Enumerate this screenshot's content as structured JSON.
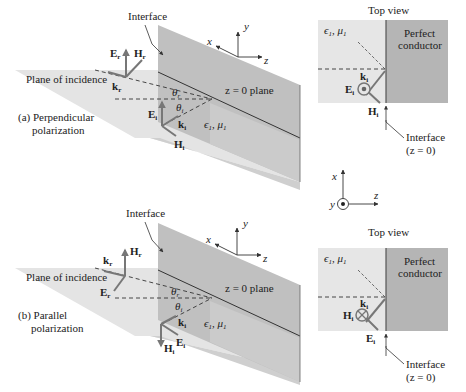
{
  "figure": {
    "panels": [
      {
        "id": "a",
        "caption_line1": "(a) Perpendicular",
        "caption_line2": "polarization",
        "plane_label": "Plane of incidence",
        "interface_label": "Interface",
        "z_plane_label": "z = 0 plane",
        "medium_label": "ϵ",
        "medium_sub": "1",
        "medium_mu": "μ",
        "medium_mu_sub": "1",
        "vectors": {
          "Er": "E",
          "Er_sub": "r",
          "Hr": "H",
          "Hr_sub": "r",
          "kr": "k",
          "kr_sub": "r",
          "Ei": "E",
          "Ei_sub": "i",
          "Hi": "H",
          "Hi_sub": "i",
          "ki": "k",
          "ki_sub": "i"
        },
        "angles": {
          "theta_r": "θ",
          "theta_r_sub": "r",
          "theta_i": "θ",
          "theta_i_sub": "i"
        },
        "axes": {
          "x": "x",
          "y": "y",
          "z": "z"
        },
        "top_view": {
          "title": "Top view",
          "medium_label": "ϵ",
          "medium_sub": "1",
          "medium_mu": "μ",
          "medium_mu_sub": "1",
          "conductor_line1": "Perfect",
          "conductor_line2": "conductor",
          "k_label": "k",
          "k_sub": "i",
          "field_out_label": "E",
          "field_out_sub": "i",
          "field_out_symbol": "dot",
          "field_side_label": "H",
          "field_side_sub": "i",
          "interface_line1": "Interface",
          "interface_line2": "(z = 0)"
        }
      },
      {
        "id": "b",
        "caption_line1": "(b) Parallel",
        "caption_line2": "polarization",
        "plane_label": "Plane of incidence",
        "interface_label": "Interface",
        "z_plane_label": "z = 0 plane",
        "medium_label": "ϵ",
        "medium_sub": "1",
        "medium_mu": "μ",
        "medium_mu_sub": "1",
        "vectors": {
          "Hr": "H",
          "Hr_sub": "r",
          "kr": "k",
          "kr_sub": "r",
          "Er": "E",
          "Er_sub": "r",
          "Hi": "H",
          "Hi_sub": "i",
          "Ei": "E",
          "Ei_sub": "i",
          "ki": "k",
          "ki_sub": "i"
        },
        "angles": {
          "theta_r": "θ",
          "theta_r_sub": "r",
          "theta_i": "θ",
          "theta_i_sub": "i"
        },
        "axes": {
          "x": "x",
          "y": "y",
          "z": "z"
        },
        "top_view": {
          "title": "Top view",
          "medium_label": "ϵ",
          "medium_sub": "1",
          "medium_mu": "μ",
          "medium_mu_sub": "1",
          "conductor_line1": "Perfect",
          "conductor_line2": "conductor",
          "k_label": "k",
          "k_sub": "i",
          "field_out_label": "H",
          "field_out_sub": "i",
          "field_out_symbol": "cross",
          "field_side_label": "E",
          "field_side_sub": "i",
          "interface_line1": "Interface",
          "interface_line2": "(z = 0)"
        }
      }
    ],
    "top_view_axes": {
      "x": "x",
      "y": "y",
      "z": "z"
    },
    "colors": {
      "plane_light": "#e6e6e6",
      "plane_mid": "#d2d2d2",
      "wall": "#bdbdbd",
      "conductor": "#b3b3b3",
      "medium_box": "#e9e9e9",
      "line": "#333333",
      "vector": "#7a7a7a"
    }
  }
}
